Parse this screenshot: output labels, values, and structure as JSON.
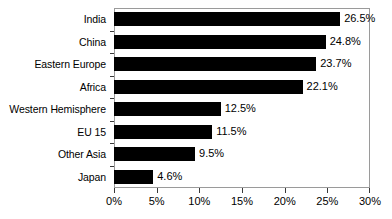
{
  "chart_data": {
    "type": "bar",
    "orientation": "horizontal",
    "title": "",
    "subtitle": "",
    "xlabel": "",
    "ylabel": "",
    "xlim": [
      0,
      30
    ],
    "grid": false,
    "legend": null,
    "xticks": [
      "0%",
      "5%",
      "10%",
      "15%",
      "20%",
      "25%",
      "30%"
    ],
    "xtick_values": [
      0,
      5,
      10,
      15,
      20,
      25,
      30
    ],
    "categories": [
      "India",
      "China",
      "Eastern Europe",
      "Africa",
      "Western Hemisphere",
      "EU 15",
      "Other Asia",
      "Japan"
    ],
    "values": [
      26.5,
      24.8,
      23.7,
      22.1,
      12.5,
      11.5,
      9.5,
      4.6
    ],
    "data_labels": [
      "26.5%",
      "24.8%",
      "23.7%",
      "22.1%",
      "12.5%",
      "11.5%",
      "9.5%",
      "4.6%"
    ],
    "bar_color": "#000000",
    "frame_color": "#9a9a9a",
    "background_color": "#ffffff"
  }
}
